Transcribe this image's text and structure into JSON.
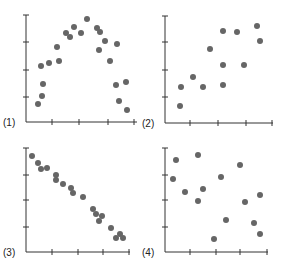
{
  "figure": {
    "width": 281,
    "height": 266,
    "point_color": "#666666",
    "axis_color": "#333333",
    "point_radius": 3
  },
  "chart_data": [
    {
      "type": "scatter",
      "panel_label": "(1)",
      "description": "inverted-U (curved) relationship",
      "axes_px": {
        "x0": 26,
        "x1": 137,
        "y_top": 15,
        "y_axis_bottom": 122
      },
      "x_ticks_px": [
        52,
        79,
        108,
        134
      ],
      "y_ticks_px": [
        15,
        42,
        70,
        97
      ],
      "points_px": [
        [
          38,
          104
        ],
        [
          42,
          96
        ],
        [
          43,
          84
        ],
        [
          41,
          66
        ],
        [
          49,
          63
        ],
        [
          59,
          61
        ],
        [
          57,
          47
        ],
        [
          66,
          33
        ],
        [
          70,
          37
        ],
        [
          74,
          27
        ],
        [
          81,
          33
        ],
        [
          87,
          19
        ],
        [
          97,
          28
        ],
        [
          100,
          32
        ],
        [
          105,
          41
        ],
        [
          99,
          50
        ],
        [
          110,
          61
        ],
        [
          117,
          44
        ],
        [
          116,
          85
        ],
        [
          126,
          82
        ],
        [
          119,
          101
        ],
        [
          127,
          110
        ]
      ],
      "x": [
        0.5,
        0.7,
        0.76,
        0.66,
        1.0,
        1.4,
        1.35,
        1.7,
        1.85,
        2.0,
        2.3,
        2.55,
        2.95,
        3.1,
        3.3,
        3.05,
        3.5,
        3.8,
        3.75,
        4.15,
        3.85,
        4.2
      ],
      "y": [
        0.7,
        1.0,
        1.4,
        2.1,
        2.2,
        2.3,
        2.8,
        3.3,
        3.2,
        3.6,
        3.3,
        3.8,
        3.5,
        3.4,
        3.0,
        2.7,
        2.3,
        2.9,
        1.4,
        1.5,
        0.8,
        0.5
      ],
      "xlabel": "",
      "ylabel": "",
      "title": ""
    },
    {
      "type": "scatter",
      "panel_label": "(2)",
      "description": "moderate positive linear relationship",
      "axes_px": {
        "x0": 165,
        "x1": 273,
        "y_top": 16,
        "y_axis_bottom": 123
      },
      "x_ticks_px": [
        190,
        218,
        246,
        272
      ],
      "y_ticks_px": [
        16,
        42,
        70,
        97
      ],
      "points_px": [
        [
          180,
          106
        ],
        [
          181,
          87
        ],
        [
          193,
          77
        ],
        [
          203,
          87
        ],
        [
          210,
          49
        ],
        [
          223,
          65
        ],
        [
          223,
          85
        ],
        [
          223,
          31
        ],
        [
          237,
          32
        ],
        [
          244,
          65
        ],
        [
          257,
          26
        ],
        [
          260,
          41
        ]
      ],
      "x": [
        0.6,
        0.65,
        1.1,
        1.45,
        1.7,
        2.2,
        2.2,
        2.2,
        2.7,
        2.95,
        3.4,
        3.5
      ],
      "y": [
        0.6,
        1.3,
        1.7,
        1.3,
        2.7,
        2.1,
        1.4,
        3.4,
        3.4,
        2.1,
        3.6,
        3.0
      ],
      "xlabel": "",
      "ylabel": "",
      "title": ""
    },
    {
      "type": "scatter",
      "panel_label": "(3)",
      "description": "strong negative linear relationship",
      "axes_px": {
        "x0": 26,
        "x1": 130,
        "y_top": 148,
        "y_axis_bottom": 252
      },
      "x_ticks_px": [
        52,
        78,
        103,
        129
      ],
      "y_ticks_px": [
        148,
        175,
        200,
        227
      ],
      "points_px": [
        [
          32,
          156
        ],
        [
          38,
          163
        ],
        [
          41,
          169
        ],
        [
          47,
          168
        ],
        [
          56,
          175
        ],
        [
          56,
          180
        ],
        [
          63,
          184
        ],
        [
          71,
          188
        ],
        [
          73,
          193
        ],
        [
          83,
          197
        ],
        [
          93,
          209
        ],
        [
          96,
          214
        ],
        [
          102,
          216
        ],
        [
          99,
          221
        ],
        [
          111,
          228
        ],
        [
          120,
          234
        ],
        [
          116,
          238
        ],
        [
          123,
          238
        ]
      ],
      "x": [
        0.25,
        0.45,
        0.6,
        0.8,
        1.15,
        1.15,
        1.45,
        1.75,
        1.85,
        2.2,
        2.6,
        2.75,
        2.95,
        2.85,
        3.3,
        3.6,
        3.5,
        3.75
      ],
      "y": [
        3.7,
        3.4,
        3.2,
        3.2,
        3.0,
        2.8,
        2.6,
        2.5,
        2.3,
        2.2,
        1.7,
        1.5,
        1.4,
        1.2,
        0.9,
        0.7,
        0.5,
        0.5
      ],
      "xlabel": "",
      "ylabel": "",
      "title": ""
    },
    {
      "type": "scatter",
      "panel_label": "(4)",
      "description": "no apparent relationship",
      "axes_px": {
        "x0": 165,
        "x1": 268,
        "y_top": 148,
        "y_axis_bottom": 252
      },
      "x_ticks_px": [
        190,
        216,
        240,
        267
      ],
      "y_ticks_px": [
        148,
        175,
        200,
        227
      ],
      "points_px": [
        [
          176,
          160
        ],
        [
          198,
          155
        ],
        [
          173,
          179
        ],
        [
          185,
          192
        ],
        [
          203,
          189
        ],
        [
          198,
          201
        ],
        [
          221,
          177
        ],
        [
          240,
          165
        ],
        [
          245,
          202
        ],
        [
          260,
          195
        ],
        [
          226,
          220
        ],
        [
          254,
          223
        ],
        [
          260,
          234
        ],
        [
          214,
          239
        ]
      ],
      "x": [
        0.4,
        1.3,
        0.3,
        0.8,
        1.5,
        1.3,
        2.2,
        3.0,
        3.2,
        3.8,
        2.4,
        3.5,
        3.8,
        1.9
      ],
      "y": [
        3.5,
        3.6,
        2.8,
        2.3,
        2.4,
        1.9,
        2.9,
        3.3,
        1.9,
        2.2,
        1.2,
        1.1,
        0.7,
        0.5
      ],
      "xlabel": "",
      "ylabel": "",
      "title": ""
    }
  ]
}
